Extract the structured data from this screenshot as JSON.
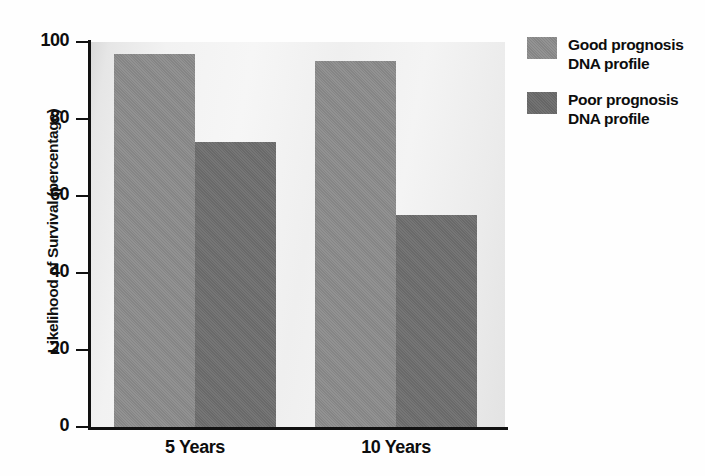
{
  "chart_data": {
    "type": "bar",
    "title": "",
    "subtitle": "",
    "xlabel": "",
    "ylabel": "Likelihood of Survival (percentage)",
    "categories": [
      "5 Years",
      "10 Years"
    ],
    "series": [
      {
        "name": "Good prognosis DNA profile",
        "values": [
          97,
          95
        ],
        "color": "#8c8c8c"
      },
      {
        "name": "Poor prognosis DNA profile",
        "values": [
          74,
          55
        ],
        "color": "#6f6f6f"
      }
    ],
    "ylim": [
      0,
      100
    ],
    "yticks": [
      0,
      20,
      40,
      60,
      80,
      100
    ],
    "ytick_labels": [
      "0",
      "20",
      "40",
      "60",
      "80",
      "100"
    ],
    "grid": false,
    "legend_position": "right",
    "legend_entries": [
      {
        "line1": "Good prognosis",
        "line2": "DNA profile",
        "swatch": "good"
      },
      {
        "line1": "Poor prognosis",
        "line2": "DNA profile",
        "swatch": "poor"
      }
    ],
    "annotations": []
  },
  "axis": {
    "y_title": "Likelihood of Survival (percentage)",
    "tick_0": "0",
    "tick_20": "20",
    "tick_40": "40",
    "tick_60": "60",
    "tick_80": "80",
    "tick_100": "100"
  },
  "categories": {
    "cat0": "5 Years",
    "cat1": "10 Years"
  },
  "legend": {
    "item0_line1": "Good prognosis",
    "item0_line2": "DNA profile",
    "item1_line1": "Poor prognosis",
    "item1_line2": "DNA profile"
  },
  "colors": {
    "good_bar": "#8c8c8c",
    "poor_bar": "#6f6f6f",
    "axis": "#111111",
    "plot_background": "#f2f2f2"
  }
}
